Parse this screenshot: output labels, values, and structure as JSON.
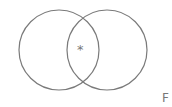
{
  "diagram": {
    "type": "venn",
    "circles": [
      {
        "name": "left",
        "cx": 59,
        "cy": 50,
        "r": 40
      },
      {
        "name": "right",
        "cx": 107,
        "cy": 50,
        "r": 40
      }
    ],
    "stroke_color": "#7a7a7a",
    "intersection_marker": "*",
    "corner_label": "F"
  }
}
